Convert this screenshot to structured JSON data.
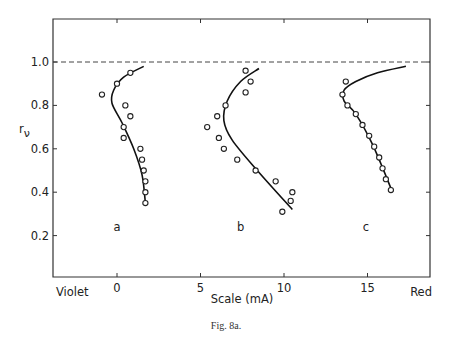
{
  "caption": "Fig. 8a.",
  "chart_data": {
    "type": "scatter",
    "title": "",
    "xlabel": "Scale (mA)",
    "ylabel": "r_ν",
    "ylabel_display": "r",
    "ylabel_subscript": "ν",
    "xlim": [
      -3.8,
      18.8
    ],
    "ylim": [
      0,
      1.2
    ],
    "x_ticks": [
      0,
      5,
      10,
      15
    ],
    "x_tick_labels": [
      "0",
      "5",
      "10",
      "15"
    ],
    "x_end_labels": {
      "left": "Violet",
      "right": "Red"
    },
    "y_ticks": [
      0.2,
      0.4,
      0.6,
      0.8,
      1.0
    ],
    "y_tick_labels": [
      "0.2",
      "0.4",
      "0.6",
      "0.8",
      "1.0"
    ],
    "grid": false,
    "legend": null,
    "reference_line": {
      "y": 1.0,
      "style": "dashed"
    },
    "series": [
      {
        "name": "a",
        "label_position": {
          "x": 0,
          "y": 0.24
        },
        "points": [
          {
            "x": 0.8,
            "y": 0.95
          },
          {
            "x": 0.0,
            "y": 0.9
          },
          {
            "x": -0.9,
            "y": 0.85
          },
          {
            "x": 0.5,
            "y": 0.8
          },
          {
            "x": 0.8,
            "y": 0.75
          },
          {
            "x": 0.4,
            "y": 0.7
          },
          {
            "x": 0.4,
            "y": 0.65
          },
          {
            "x": 1.4,
            "y": 0.6
          },
          {
            "x": 1.5,
            "y": 0.55
          },
          {
            "x": 1.6,
            "y": 0.5
          },
          {
            "x": 1.7,
            "y": 0.45
          },
          {
            "x": 1.7,
            "y": 0.4
          },
          {
            "x": 1.7,
            "y": 0.35
          }
        ],
        "fit_curve": [
          {
            "x": 1.6,
            "y": 0.98
          },
          {
            "x": 0.4,
            "y": 0.93
          },
          {
            "x": -0.2,
            "y": 0.87
          },
          {
            "x": -0.3,
            "y": 0.81
          },
          {
            "x": 0.3,
            "y": 0.72
          },
          {
            "x": 1.0,
            "y": 0.6
          },
          {
            "x": 1.5,
            "y": 0.48
          },
          {
            "x": 1.7,
            "y": 0.35
          }
        ]
      },
      {
        "name": "b",
        "label_position": {
          "x": 7.4,
          "y": 0.24
        },
        "points": [
          {
            "x": 7.7,
            "y": 0.96
          },
          {
            "x": 8.0,
            "y": 0.91
          },
          {
            "x": 7.7,
            "y": 0.86
          },
          {
            "x": 6.5,
            "y": 0.8
          },
          {
            "x": 6.0,
            "y": 0.75
          },
          {
            "x": 5.4,
            "y": 0.7
          },
          {
            "x": 6.1,
            "y": 0.65
          },
          {
            "x": 6.4,
            "y": 0.6
          },
          {
            "x": 7.2,
            "y": 0.55
          },
          {
            "x": 8.3,
            "y": 0.5
          },
          {
            "x": 9.5,
            "y": 0.45
          },
          {
            "x": 10.5,
            "y": 0.4
          },
          {
            "x": 10.4,
            "y": 0.36
          },
          {
            "x": 9.9,
            "y": 0.31
          }
        ],
        "fit_curve": [
          {
            "x": 8.5,
            "y": 0.97
          },
          {
            "x": 7.4,
            "y": 0.91
          },
          {
            "x": 6.6,
            "y": 0.82
          },
          {
            "x": 6.4,
            "y": 0.73
          },
          {
            "x": 6.9,
            "y": 0.64
          },
          {
            "x": 8.4,
            "y": 0.5
          },
          {
            "x": 10.5,
            "y": 0.32
          }
        ]
      },
      {
        "name": "c",
        "label_position": {
          "x": 14.9,
          "y": 0.24
        },
        "points": [
          {
            "x": 13.7,
            "y": 0.91
          },
          {
            "x": 13.5,
            "y": 0.85
          },
          {
            "x": 13.8,
            "y": 0.8
          },
          {
            "x": 14.3,
            "y": 0.76
          },
          {
            "x": 14.7,
            "y": 0.71
          },
          {
            "x": 15.1,
            "y": 0.66
          },
          {
            "x": 15.4,
            "y": 0.61
          },
          {
            "x": 15.7,
            "y": 0.56
          },
          {
            "x": 15.9,
            "y": 0.51
          },
          {
            "x": 16.1,
            "y": 0.46
          },
          {
            "x": 16.4,
            "y": 0.41
          }
        ],
        "fit_curve": [
          {
            "x": 17.3,
            "y": 0.98
          },
          {
            "x": 15.6,
            "y": 0.95
          },
          {
            "x": 14.3,
            "y": 0.91
          },
          {
            "x": 13.6,
            "y": 0.87
          },
          {
            "x": 13.6,
            "y": 0.82
          },
          {
            "x": 14.3,
            "y": 0.76
          },
          {
            "x": 15.3,
            "y": 0.62
          },
          {
            "x": 16.5,
            "y": 0.4
          }
        ]
      }
    ]
  }
}
